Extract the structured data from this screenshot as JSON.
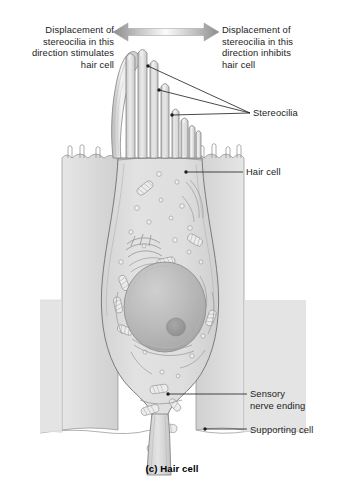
{
  "figure": {
    "caption": "(c) Hair cell",
    "background_color": "#ffffff",
    "ink_color": "#1c1c1c"
  },
  "annotations": {
    "left_displacement": "Displacement of\nstereocilia in this\ndirection stimulates\nhair cell",
    "right_displacement": "Displacement of\nstereocilia in this\ndirection inhibits\nhair cell",
    "stereocilia": "Stereocilia",
    "hair_cell": "Hair cell",
    "sensory_nerve_ending": "Sensory\nnerve ending",
    "supporting_cell": "Supporting cell"
  },
  "arrow": {
    "name": "displacement-direction-arrow",
    "description": "horizontal double-headed arrow",
    "left_x": 113,
    "right_x": 219,
    "center_y": 32,
    "fill_dark": "#8c8c8c",
    "fill_light": "#f2f2f2"
  },
  "leaders": {
    "stereocilia_converge_x": 250,
    "stereocilia_converge_y": 113,
    "stereocilia_points": [
      {
        "x": 148,
        "y": 66
      },
      {
        "x": 159,
        "y": 90
      },
      {
        "x": 172,
        "y": 115
      }
    ],
    "hair_cell_point": {
      "x": 186,
      "y": 172
    },
    "sensory_nerve_point": {
      "x": 168,
      "y": 394
    },
    "supporting_cell_point": {
      "x": 205,
      "y": 429
    }
  },
  "cell_parts": {
    "kinocilium": "kinocilium",
    "stereocilia_count": 9,
    "hair_cell_body": "hair cell body",
    "nucleus": "nucleus",
    "nucleolus": "nucleolus",
    "golgi": "Golgi apparatus",
    "mitochondria": "mitochondria",
    "vesicles": "synaptic vesicles",
    "rough_er": "rough endoplasmic reticulum",
    "supporting_cells": "supporting cells",
    "microvilli": "microvilli",
    "nerve_fiber": "afferent nerve fiber"
  },
  "palette": {
    "cytoplasm": "#dcdcdc",
    "cytoplasm_light": "#e8e8e8",
    "supporting_fill": "#d2d2d2",
    "nucleus_fill": "#b5b5b5",
    "nucleolus_fill": "#9a9a9a",
    "outline": "#6e6e6e",
    "outline_dark": "#4a4a4a",
    "organelle_fill": "#ededed"
  }
}
